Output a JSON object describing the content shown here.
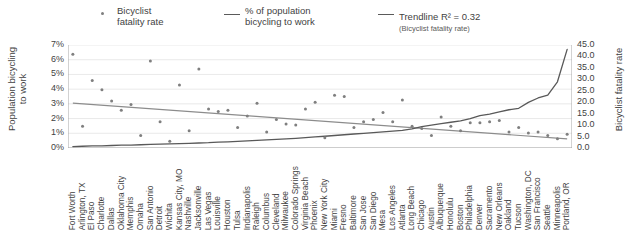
{
  "legend": {
    "bicyclist": {
      "label": "Bicyclist\nfatality rate",
      "marker": "dot-marker-icon",
      "color": "#7f7f7f"
    },
    "population": {
      "label": "% of population\nbicycling to work",
      "marker": "line-marker-icon",
      "color": "#595959"
    },
    "trendline": {
      "label": "Trendline R² = 0.32",
      "sublabel": "(Bicyclist fatality rate)",
      "marker": "line-marker-icon",
      "color": "#8c8c8c"
    }
  },
  "axes": {
    "left_title": "Population bicycling\nto work",
    "right_title": "Bicyclist fatality rate",
    "left_ticks": [
      "7%",
      "6%",
      "5%",
      "4%",
      "3%",
      "2%",
      "1%",
      "0%"
    ],
    "right_ticks": [
      "45.0",
      "40.0",
      "35.0",
      "30.0",
      "25.0",
      "20.0",
      "15.0",
      "10.0",
      "5.0",
      "0.0"
    ]
  },
  "chart_data": {
    "type": "scatter",
    "title": "",
    "xlabel": "",
    "ylabel": "Population bicycling to work",
    "y2label": "Bicyclist fatality rate",
    "ylim": [
      0,
      7
    ],
    "y2lim": [
      0,
      45
    ],
    "grid": true,
    "legend_position": "top",
    "categories": [
      "Fort Worth",
      "Arlington, TX",
      "El Paso",
      "Charlotte",
      "Dallas",
      "Oklahoma City",
      "Memphis",
      "Omaha",
      "San Antonio",
      "Detroit",
      "Wichita",
      "Kansas City, MO",
      "Nashville",
      "Jacksonville",
      "Las Vegas",
      "Louisville",
      "Houston",
      "Tulsa",
      "Indianapolis",
      "Raleigh",
      "Columbus",
      "Cleveland",
      "Milwaukee",
      "Colorado Springs",
      "Virginia Beach",
      "Phoenix",
      "New York City",
      "Miami",
      "Fresno",
      "Baltimore",
      "San Jose",
      "San Diego",
      "Mesa",
      "Los Angeles",
      "Atlanta",
      "Long Beach",
      "Chicago",
      "Austin",
      "Albuquerque",
      "Honolulu",
      "Boston",
      "Philadelphia",
      "Denver",
      "Sacramento",
      "New Orleans",
      "Oakland",
      "Tucson",
      "Washington, DC",
      "San Francisco",
      "Seattle",
      "Minneapolis",
      "Portland, OR"
    ],
    "series": [
      {
        "name": "Bicyclist fatality rate",
        "axis": "y2",
        "type": "scatter",
        "color": "#7f7f7f",
        "values": [
          41.0,
          9.5,
          29.5,
          25.5,
          20.5,
          16.5,
          19.0,
          5.5,
          38.0,
          11.5,
          3.0,
          27.5,
          7.5,
          34.5,
          17.0,
          16.0,
          16.5,
          9.0,
          14.0,
          19.5,
          7.0,
          12.5,
          10.5,
          10.0,
          17.0,
          20.0,
          4.5,
          23.0,
          22.5,
          9.0,
          11.5,
          12.5,
          15.5,
          11.5,
          21.0,
          9.5,
          8.5,
          5.5,
          13.5,
          9.5,
          7.5,
          11.0,
          11.0,
          11.5,
          12.0,
          7.0,
          9.0,
          6.5,
          7.0,
          5.5,
          4.0,
          6.0
        ]
      },
      {
        "name": "% of population bicycling to work",
        "axis": "y1",
        "type": "line",
        "color": "#595959",
        "values": [
          0.1,
          0.12,
          0.14,
          0.15,
          0.17,
          0.19,
          0.2,
          0.22,
          0.24,
          0.26,
          0.28,
          0.3,
          0.32,
          0.34,
          0.36,
          0.4,
          0.42,
          0.45,
          0.48,
          0.52,
          0.55,
          0.58,
          0.62,
          0.66,
          0.7,
          0.75,
          0.8,
          0.85,
          0.9,
          0.95,
          1.0,
          1.05,
          1.1,
          1.15,
          1.2,
          1.3,
          1.45,
          1.55,
          1.65,
          1.75,
          1.85,
          2.0,
          2.2,
          2.3,
          2.45,
          2.6,
          2.7,
          3.1,
          3.4,
          3.6,
          4.5,
          6.7
        ]
      },
      {
        "name": "Trendline (Bicyclist fatality rate)",
        "axis": "y1",
        "type": "trendline",
        "color": "#8c8c8c",
        "r_squared": 0.32,
        "endpoints": [
          3.05,
          0.62
        ]
      }
    ]
  }
}
